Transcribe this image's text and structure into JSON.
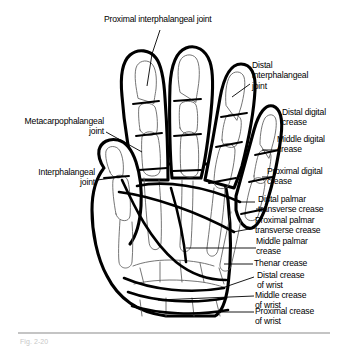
{
  "figure": {
    "caption": "Fig. 2-20",
    "background_color": "#ffffff",
    "ink_color": "#000000",
    "bone_line_color": "#5c5c5c"
  },
  "labels": {
    "proximal_interphalangeal_joint": "Proximal interphalangeal joint",
    "distal_interphalangeal_joint": "Distal\ninterphalangeal\njoint",
    "metacarpophalangeal_joint": "Metacarpophalangeal\njoint",
    "interphalangeal_joint": "Interphalangeal\njoint",
    "distal_digital_crease": "Distal digital\ncrease",
    "middle_digital_crease": "Middle digital\ncrease",
    "proximal_digital_crease": "Proximal digital\ncrease",
    "distal_palmar_transverse_crease": "Distal palmar\ntransverse crease",
    "proximal_palmar_transverse_crease": "Proximal palmar\ntransverse crease",
    "middle_palmar_crease": "Middle palmar\ncrease",
    "thenar_crease": "Thenar crease",
    "distal_crease_of_wrist": "Distal crease\nof wrist",
    "middle_crease_of_wrist": "Middle crease\nof wrist",
    "proximal_crease_of_wrist": "Proximal crease\nof wrist"
  },
  "anatomy": {
    "joints": [
      "Proximal interphalangeal joint",
      "Distal interphalangeal joint",
      "Metacarpophalangeal joint",
      "Interphalangeal joint"
    ],
    "digital_creases": [
      "Distal digital crease",
      "Middle digital crease",
      "Proximal digital crease"
    ],
    "palmar_creases": [
      "Distal palmar transverse crease",
      "Proximal palmar transverse crease",
      "Middle palmar crease",
      "Thenar crease"
    ],
    "wrist_creases": [
      "Distal crease of wrist",
      "Middle crease of wrist",
      "Proximal crease of wrist"
    ]
  }
}
